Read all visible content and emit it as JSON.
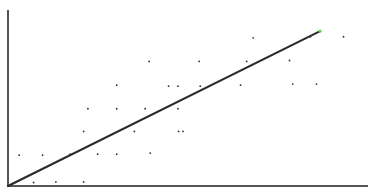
{
  "chart_data": {
    "type": "scatter",
    "title": "",
    "xlabel": "",
    "ylabel": "",
    "grid": false,
    "legend": null,
    "xlim": [
      0,
      100
    ],
    "ylim": [
      0,
      100
    ],
    "points": [
      {
        "x": 3.1,
        "y": 17.5
      },
      {
        "x": 9.6,
        "y": 17.5
      },
      {
        "x": 17.2,
        "y": 18.1
      },
      {
        "x": 24.9,
        "y": 18.1
      },
      {
        "x": 30.2,
        "y": 18.1
      },
      {
        "x": 39.5,
        "y": 18.7
      },
      {
        "x": 7.1,
        "y": 2.0
      },
      {
        "x": 13.3,
        "y": 2.3
      },
      {
        "x": 21.0,
        "y": 2.3
      },
      {
        "x": 21.0,
        "y": 31.0
      },
      {
        "x": 35.1,
        "y": 31.0
      },
      {
        "x": 22.2,
        "y": 43.9
      },
      {
        "x": 30.2,
        "y": 43.9
      },
      {
        "x": 38.1,
        "y": 43.9
      },
      {
        "x": 47.2,
        "y": 43.9
      },
      {
        "x": 47.4,
        "y": 31.0
      },
      {
        "x": 48.6,
        "y": 31.0
      },
      {
        "x": 30.2,
        "y": 57.3
      },
      {
        "x": 39.2,
        "y": 70.8
      },
      {
        "x": 44.6,
        "y": 56.7
      },
      {
        "x": 47.2,
        "y": 56.7
      },
      {
        "x": 53.4,
        "y": 56.7
      },
      {
        "x": 53.1,
        "y": 70.8
      },
      {
        "x": 64.6,
        "y": 57.3
      },
      {
        "x": 66.3,
        "y": 70.8
      },
      {
        "x": 68.1,
        "y": 84.2
      },
      {
        "x": 78.2,
        "y": 71.3
      },
      {
        "x": 79.1,
        "y": 57.9
      },
      {
        "x": 85.7,
        "y": 57.9
      },
      {
        "x": 84.0,
        "y": 84.8
      },
      {
        "x": 93.2,
        "y": 84.8
      }
    ],
    "regression_line": {
      "x": [
        0,
        86.7
      ],
      "y": [
        0,
        88.0
      ]
    },
    "colors": {
      "points": "#333333",
      "line": "#2b2b2b",
      "line_end_highlight": "#66dd44",
      "axes": "#555555"
    },
    "plot_box_px": {
      "left": 8,
      "top": 10,
      "right": 368,
      "bottom": 186
    }
  }
}
